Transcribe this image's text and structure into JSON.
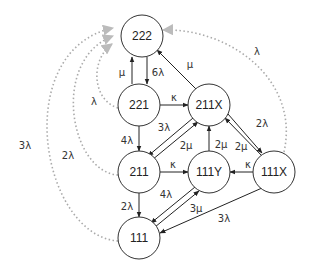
{
  "diagram": {
    "type": "state-transition-diagram",
    "colors": {
      "node_stroke": "#333333",
      "edge": "#222222",
      "dotted_edge": "#aaaaaa",
      "dotted_arrow": "#bbbbbb"
    },
    "nodes": [
      {
        "id": "222",
        "label": "222"
      },
      {
        "id": "221",
        "label": "221"
      },
      {
        "id": "211X",
        "label": "211X"
      },
      {
        "id": "211",
        "label": "211"
      },
      {
        "id": "111Y",
        "label": "111Y"
      },
      {
        "id": "111X",
        "label": "111X"
      },
      {
        "id": "111",
        "label": "111"
      }
    ],
    "edges": [
      {
        "from": "221",
        "to": "222",
        "label": "μ",
        "style": "solid"
      },
      {
        "from": "222",
        "to": "221",
        "label": "6λ",
        "style": "solid"
      },
      {
        "from": "211X",
        "to": "222",
        "label": "μ",
        "style": "solid"
      },
      {
        "from": "221",
        "to": "211X",
        "label": "κ",
        "style": "solid"
      },
      {
        "from": "221",
        "to": "211",
        "label": "4λ",
        "style": "solid"
      },
      {
        "from": "211X",
        "to": "211",
        "label": "3λ",
        "style": "solid"
      },
      {
        "from": "211",
        "to": "211X",
        "label": "2μ",
        "style": "solid"
      },
      {
        "from": "111Y",
        "to": "211X",
        "label": "2μ",
        "style": "solid"
      },
      {
        "from": "211X",
        "to": "111X",
        "label": "2λ",
        "style": "solid"
      },
      {
        "from": "111X",
        "to": "211X",
        "label": "2μ",
        "style": "solid"
      },
      {
        "from": "211",
        "to": "111Y",
        "label": "κ",
        "style": "solid"
      },
      {
        "from": "111X",
        "to": "111Y",
        "label": "κ",
        "style": "solid"
      },
      {
        "from": "211",
        "to": "111",
        "label": "2λ",
        "style": "solid"
      },
      {
        "from": "111Y",
        "to": "111",
        "label": "4λ",
        "style": "solid"
      },
      {
        "from": "111",
        "to": "111Y",
        "label": "3μ",
        "style": "solid"
      },
      {
        "from": "111X",
        "to": "111",
        "label": "3λ",
        "style": "solid"
      },
      {
        "from": "221",
        "to": "222",
        "label": "λ",
        "style": "dotted"
      },
      {
        "from": "211",
        "to": "222",
        "label": "2λ",
        "style": "dotted"
      },
      {
        "from": "111",
        "to": "222",
        "label": "3λ",
        "style": "dotted"
      },
      {
        "from": "111X",
        "to": "222",
        "label": "λ",
        "style": "dotted"
      }
    ],
    "labels": {
      "n222": "222",
      "n221": "221",
      "n211X": "211X",
      "n211": "211",
      "n111Y": "111Y",
      "n111X": "111X",
      "n111": "111",
      "e_221_222_mu": "μ",
      "e_222_221_6lambda": "6λ",
      "e_211X_222_mu": "μ",
      "e_221_211X_kappa": "κ",
      "e_221_211_4lambda": "4λ",
      "e_211X_211_3lambda": "3λ",
      "e_211_211X_2mu": "2μ",
      "e_111Y_211X_2mu": "2μ",
      "e_211X_111X_2lambda": "2λ",
      "e_111X_211X_2mu": "2μ",
      "e_211_111Y_kappa": "κ",
      "e_111X_111Y_kappa": "κ",
      "e_211_111_2lambda": "2λ",
      "e_111Y_111_4lambda": "4λ",
      "e_111_111Y_3mu": "3μ",
      "e_111X_111_3lambda": "3λ",
      "d_221_222_lambda": "λ",
      "d_211_222_2lambda": "2λ",
      "d_111_222_3lambda": "3λ",
      "d_111X_222_lambda": "λ"
    }
  }
}
